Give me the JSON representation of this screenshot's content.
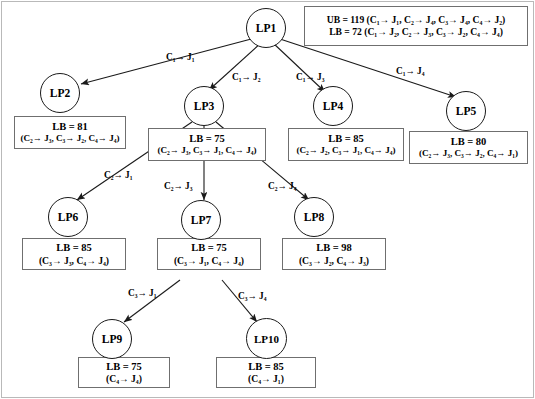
{
  "diagram": {
    "nodes": [
      {
        "id": "LP1",
        "label": "LP1"
      },
      {
        "id": "LP2",
        "label": "LP2"
      },
      {
        "id": "LP3",
        "label": "LP3"
      },
      {
        "id": "LP4",
        "label": "LP4"
      },
      {
        "id": "LP5",
        "label": "LP5"
      },
      {
        "id": "LP6",
        "label": "LP6"
      },
      {
        "id": "LP7",
        "label": "LP7"
      },
      {
        "id": "LP8",
        "label": "LP8"
      },
      {
        "id": "LP9",
        "label": "LP9"
      },
      {
        "id": "LP10",
        "label": "LP10"
      }
    ],
    "boxes": {
      "lp1": {
        "line1": "UB = 119 (C₁→ J₁, C₂→ J₄, C₃→ J₄, C₄→ J₂)",
        "line2": "LB = 72 (C₁→ J₂, C₂→ J₃, C₃→ J₂, C₄→ J₄)"
      },
      "lp2": {
        "line1": "LB = 81",
        "line2": "(C₂→ J₃, C₃→ J₂, C₄→ J₄)"
      },
      "lp3": {
        "line1": "LB = 75",
        "line2": "(C₂→ J₃, C₃→ J₁, C₄→ J₄)"
      },
      "lp4": {
        "line1": "LB = 85",
        "line2": "(C₂→ J₂, C₃→ J₁, C₄→ J₄)"
      },
      "lp5": {
        "line1": "LB = 80",
        "line2": "(C₂→ J₃, C₃→ J₂, C₄→ J₁)"
      },
      "lp6": {
        "line1": "LB = 85",
        "line2": "(C₃→ J₃, C₄→ J₄)"
      },
      "lp7": {
        "line1": "LB = 75",
        "line2": "(C₃→ J₁, C₄→ J₄)"
      },
      "lp8": {
        "line1": "LB = 98",
        "line2": "(C₃→ J₂, C₄→ J₃)"
      },
      "lp9": {
        "line1": "LB = 75",
        "line2": "(C₄→ J₄)"
      },
      "lp10": {
        "line1": "LB = 85",
        "line2": "(C₄→ J₁)"
      }
    },
    "edge_labels": {
      "lp1_lp2": "C₁→ J₁",
      "lp1_lp3": "C₁→ J₂",
      "lp1_lp4": "C₁→ J₃",
      "lp1_lp5": "C₁→ J₄",
      "lp3_lp6": "C₂→ J₁",
      "lp3_lp7": "C₂→ J₃",
      "lp3_lp8": "C₂→ J₄",
      "lp7_lp9": "C₃→ J₁",
      "lp7_lp10": "C₃→ J₄"
    },
    "colors": {
      "node_stroke": "#1a1a1a",
      "box_stroke": "#6f6f6f",
      "edge_stroke": "#1a1a1a",
      "background": "#ffffff",
      "frame": "#b9b9b9"
    }
  }
}
